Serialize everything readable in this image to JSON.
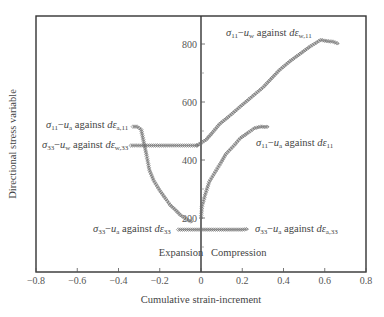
{
  "chart_data": {
    "type": "scatter",
    "title": "",
    "xlabel": "Cumulative strain-increment",
    "ylabel": "Directional stress variable",
    "xlim": [
      -0.8,
      0.8
    ],
    "ylim": [
      0,
      900
    ],
    "grid": false,
    "legend": "none (inline annotations)",
    "x_ticks": [
      -0.8,
      -0.6,
      -0.4,
      -0.2,
      0,
      0.2,
      0.4,
      0.6,
      0.8
    ],
    "x_tick_labels": [
      "−0.8",
      "−0.6",
      "−0.4",
      "−0.2",
      "0",
      "0.2",
      "0.4",
      "0.6",
      "0.8"
    ],
    "y_ticks": [
      200,
      400,
      600,
      800
    ],
    "y_tick_labels": [
      "200",
      "400",
      "600",
      "800"
    ],
    "y_minor_ticks": [
      100,
      300,
      500,
      700
    ],
    "region_labels": {
      "left": "Expansion",
      "right": "Compression"
    },
    "series": [
      {
        "name": "σ11−uw against dεw,11",
        "label_parts": [
          "σ",
          "11",
          "−",
          "u",
          "w",
          " against ",
          "dε",
          "w,11"
        ],
        "x": [
          -0.02,
          0.025,
          0.05,
          0.09,
          0.14,
          0.19,
          0.24,
          0.3,
          0.38,
          0.43,
          0.48,
          0.53,
          0.56,
          0.58,
          0.61,
          0.64,
          0.67
        ],
        "y": [
          450,
          470,
          490,
          524,
          553,
          584,
          614,
          650,
          710,
          740,
          766,
          792,
          805,
          814,
          810,
          808,
          800
        ]
      },
      {
        "name": "σ11−ua against dε11",
        "label_parts": [
          "σ",
          "11",
          "−",
          "u",
          "a",
          " against ",
          "dε",
          "11"
        ],
        "x": [
          0.0,
          0.005,
          0.02,
          0.04,
          0.07,
          0.1,
          0.12,
          0.16,
          0.19,
          0.23,
          0.26,
          0.29,
          0.31,
          0.33
        ],
        "y": [
          200,
          240,
          280,
          325,
          360,
          395,
          420,
          450,
          475,
          495,
          510,
          515,
          514,
          515
        ]
      },
      {
        "name": "σ11−ua against dεa,11",
        "label_parts": [
          "σ",
          "11",
          "−",
          "u",
          "a",
          " against ",
          "dε",
          "a,11"
        ],
        "x": [
          -0.33,
          -0.31,
          -0.29,
          -0.28,
          -0.265,
          -0.25,
          -0.23,
          -0.2,
          -0.17,
          -0.15,
          -0.12,
          -0.1,
          -0.07,
          -0.04
        ],
        "y": [
          515,
          515,
          505,
          470,
          420,
          365,
          330,
          295,
          265,
          245,
          225,
          210,
          195,
          185
        ]
      },
      {
        "name": "σ33−uw against dεw,33",
        "label_parts": [
          "σ",
          "33",
          "−",
          "u",
          "w",
          " against ",
          "dε",
          "w,33"
        ],
        "x": [
          -0.34,
          -0.3,
          -0.25,
          -0.2,
          -0.15,
          -0.1,
          -0.05,
          -0.01
        ],
        "y": [
          450,
          450,
          450,
          450,
          450,
          450,
          450,
          450
        ]
      },
      {
        "name": "σ33−ua against dε33",
        "label_parts": [
          "σ",
          "33",
          "−",
          "u",
          "a",
          " against ",
          "dε",
          "33"
        ],
        "x": [
          -0.11,
          -0.08,
          -0.05,
          -0.02,
          0.0
        ],
        "y": [
          160,
          160,
          160,
          160,
          160
        ]
      },
      {
        "name": "σ33−ua against dεa,33",
        "label_parts": [
          "σ",
          "33",
          "−",
          "u",
          "a",
          " against ",
          "dε",
          "a,33"
        ],
        "x": [
          0.0,
          0.05,
          0.1,
          0.15,
          0.2,
          0.23
        ],
        "y": [
          160,
          160,
          160,
          160,
          160,
          162
        ]
      }
    ]
  },
  "annotations": {
    "s11_uw_w11": {
      "sigma": "σ",
      "sub1": "11",
      "dash": "−",
      "u": "u",
      "usub": "w",
      "against": " against ",
      "de": "dε",
      "desub": "w,11"
    },
    "s11_ua_11": {
      "sigma": "σ",
      "sub1": "11",
      "dash": "−",
      "u": "u",
      "usub": "a",
      "against": " against ",
      "de": "dε",
      "desub": "11"
    },
    "s11_ua_a11": {
      "sigma": "σ",
      "sub1": "11",
      "dash": "−",
      "u": "u",
      "usub": "a",
      "against": " against ",
      "de": "dε",
      "desub": "a,11"
    },
    "s33_uw_w33": {
      "sigma": "σ",
      "sub1": "33",
      "dash": "−",
      "u": "u",
      "usub": "w",
      "against": " against ",
      "de": "dε",
      "desub": "w,33"
    },
    "s33_ua_33": {
      "sigma": "σ",
      "sub1": "33",
      "dash": "−",
      "u": "u",
      "usub": "a",
      "against": " against ",
      "de": "dε",
      "desub": "33"
    },
    "s33_ua_a33": {
      "sigma": "σ",
      "sub1": "33",
      "dash": "−",
      "u": "u",
      "usub": "a",
      "against": " against ",
      "de": "dε",
      "desub": "a,33"
    }
  },
  "style": {
    "marker_color": "#6b6b6b",
    "frame_color": "#333333",
    "text_color": "#444444"
  }
}
